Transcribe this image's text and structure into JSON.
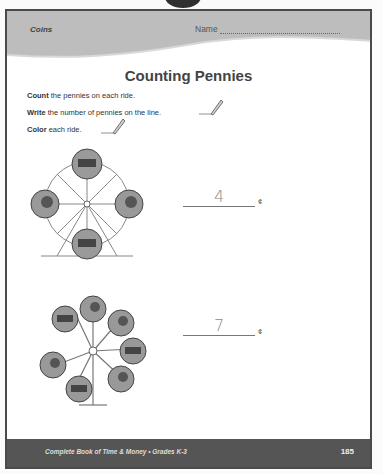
{
  "header": {
    "topic": "Coins",
    "name_label": "Name"
  },
  "title": "Counting Pennies",
  "instructions": [
    {
      "bold": "Count",
      "text": " the pennies on each ride."
    },
    {
      "bold": "Write",
      "text": " the number of pennies on the line."
    },
    {
      "bold": "Color",
      "text": " each ride."
    }
  ],
  "problems": [
    {
      "ride": "ferris-wheel",
      "pennies": 4,
      "answer": "4",
      "unit": "¢"
    },
    {
      "ride": "swing-carousel",
      "pennies": 7,
      "answer": "7",
      "unit": "¢"
    }
  ],
  "footer": {
    "book": "Complete Book of Time & Money  •  Grades K-3",
    "page_number": "185"
  }
}
